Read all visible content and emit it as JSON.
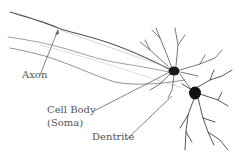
{
  "diagram": {
    "type": "neuron-illustration",
    "labels": {
      "axon": "Axon",
      "cell_body_line1": "Cell Body",
      "cell_body_line2": "(Soma)",
      "dentrite": "Dentrite"
    },
    "colors": {
      "background": "#ffffff",
      "label_text": "#555555",
      "pointer": "#666666",
      "neuron_dark": "#1a1a1a",
      "neuron_light": "#999999"
    }
  }
}
